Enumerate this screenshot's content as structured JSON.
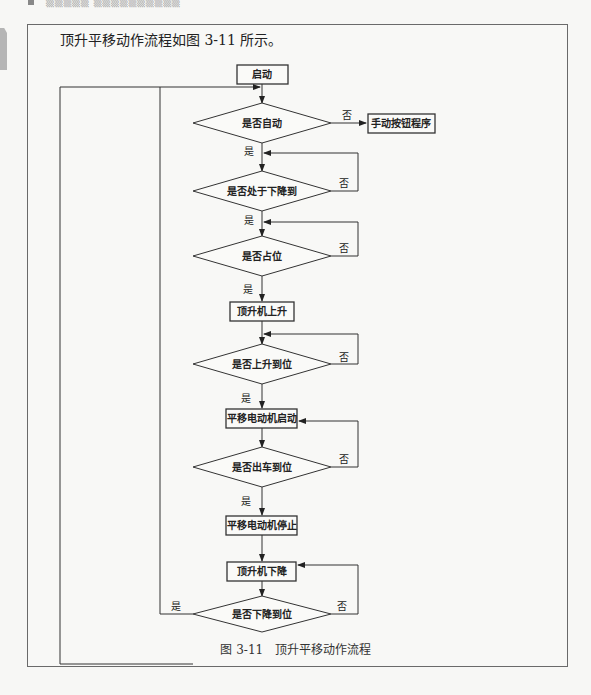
{
  "page": {
    "header_text": "▒▒▒▒▒ ▒▒▒▒▒▒▒▒▒▒",
    "intro": "顶升平移动作流程如图 3-11 所示。",
    "caption": "图 3-11   顶升平移动作流程"
  },
  "flowchart": {
    "nodes": {
      "start": "启动",
      "auto": "是否自动",
      "manual": "手动按钮程序",
      "down_pos": "是否处于下降到",
      "occupied": "是否占位",
      "lift_up": "顶升机上升",
      "up_done": "是否上升到位",
      "motor_start": "平移电动机启动",
      "car_out": "是否出车到位",
      "motor_stop": "平移电动机停止",
      "lift_down": "顶升机下降",
      "down_done": "是否下降到位"
    },
    "labels": {
      "yes": "是",
      "no": "否"
    }
  }
}
